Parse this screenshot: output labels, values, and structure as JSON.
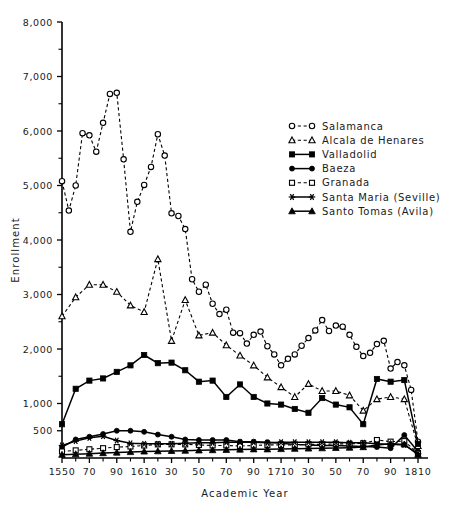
{
  "chart_data": {
    "type": "line",
    "title": "",
    "xlabel": "Academic Year",
    "ylabel": "Enrollment",
    "xlim": [
      1550,
      1810
    ],
    "ylim": [
      0,
      8000
    ],
    "grid": false,
    "legend_position": "right",
    "y_ticklabels": [
      "8,000",
      "7,000",
      "6,000",
      "5,000",
      "4,000",
      "3,000",
      "2,000",
      "1,000",
      "500"
    ],
    "y_tickvalues": [
      8000,
      7000,
      6000,
      5000,
      4000,
      3000,
      2000,
      1000,
      500
    ],
    "y_minor_tickvalues": [
      7500,
      6500,
      5500,
      4500,
      3500,
      2500,
      1500
    ],
    "x_ticklabels": [
      "1550",
      "70",
      "90",
      "1610",
      "30",
      "50",
      "70",
      "90",
      "1710",
      "30",
      "50",
      "70",
      "90",
      "1810"
    ],
    "x_tickvalues": [
      1550,
      1570,
      1590,
      1610,
      1630,
      1650,
      1670,
      1690,
      1710,
      1730,
      1750,
      1770,
      1790,
      1810
    ],
    "series": [
      {
        "name": "Salamanca",
        "marker": "circle-open",
        "linestyle": "dashed",
        "x": [
          1550,
          1555,
          1560,
          1565,
          1570,
          1575,
          1580,
          1585,
          1590,
          1595,
          1600,
          1605,
          1610,
          1615,
          1620,
          1625,
          1630,
          1635,
          1640,
          1645,
          1650,
          1655,
          1660,
          1665,
          1670,
          1675,
          1680,
          1685,
          1690,
          1695,
          1700,
          1705,
          1710,
          1715,
          1720,
          1725,
          1730,
          1735,
          1740,
          1745,
          1750,
          1755,
          1760,
          1765,
          1770,
          1775,
          1780,
          1785,
          1790,
          1795,
          1800,
          1805,
          1810
        ],
        "values": [
          5080,
          4540,
          5000,
          5960,
          5920,
          5620,
          6150,
          6680,
          6700,
          5480,
          4150,
          4700,
          5010,
          5340,
          5940,
          5550,
          4490,
          4440,
          4200,
          3280,
          3050,
          3180,
          2830,
          2640,
          2720,
          2300,
          2290,
          2100,
          2260,
          2320,
          2050,
          1900,
          1700,
          1820,
          1900,
          2060,
          2200,
          2340,
          2530,
          2330,
          2430,
          2410,
          2260,
          2040,
          1870,
          1930,
          2090,
          2150,
          1640,
          1760,
          1700,
          1250,
          300
        ]
      },
      {
        "name": "Alcala de Henares",
        "marker": "triangle-open",
        "linestyle": "dashed",
        "x": [
          1550,
          1560,
          1570,
          1580,
          1590,
          1600,
          1610,
          1620,
          1630,
          1640,
          1650,
          1660,
          1670,
          1680,
          1690,
          1700,
          1710,
          1720,
          1730,
          1740,
          1750,
          1760,
          1770,
          1780,
          1790,
          1800,
          1810
        ],
        "values": [
          2600,
          2950,
          3180,
          3180,
          3050,
          2800,
          2680,
          3650,
          2150,
          2900,
          2250,
          2300,
          2070,
          1880,
          1700,
          1480,
          1300,
          1120,
          1360,
          1230,
          1230,
          1150,
          870,
          1080,
          1120,
          1080,
          220
        ]
      },
      {
        "name": "Valladolid",
        "marker": "square-fill",
        "linestyle": "solid",
        "x": [
          1550,
          1560,
          1570,
          1580,
          1590,
          1600,
          1610,
          1620,
          1630,
          1640,
          1650,
          1660,
          1670,
          1680,
          1690,
          1700,
          1710,
          1720,
          1730,
          1740,
          1750,
          1760,
          1770,
          1780,
          1790,
          1800,
          1810
        ],
        "values": [
          620,
          1270,
          1420,
          1460,
          1580,
          1700,
          1890,
          1740,
          1750,
          1610,
          1400,
          1420,
          1120,
          1350,
          1120,
          1000,
          980,
          900,
          830,
          1100,
          980,
          930,
          620,
          1450,
          1400,
          1430,
          260
        ]
      },
      {
        "name": "Baeza",
        "marker": "circle-fill",
        "linestyle": "solid",
        "x": [
          1550,
          1560,
          1570,
          1580,
          1590,
          1600,
          1610,
          1620,
          1630,
          1640,
          1650,
          1660,
          1670,
          1680,
          1690,
          1700,
          1710,
          1720,
          1730,
          1740,
          1750,
          1760,
          1770,
          1780,
          1790,
          1800,
          1810
        ],
        "values": [
          200,
          340,
          390,
          440,
          500,
          500,
          480,
          430,
          390,
          340,
          330,
          330,
          330,
          300,
          300,
          290,
          270,
          250,
          240,
          230,
          230,
          220,
          210,
          200,
          180,
          420,
          120
        ]
      },
      {
        "name": "Granada",
        "marker": "square-open",
        "linestyle": "dashed",
        "x": [
          1550,
          1560,
          1570,
          1580,
          1590,
          1600,
          1610,
          1620,
          1630,
          1640,
          1650,
          1660,
          1670,
          1680,
          1690,
          1700,
          1710,
          1720,
          1730,
          1740,
          1750,
          1760,
          1770,
          1780,
          1790,
          1800,
          1810
        ],
        "values": [
          120,
          140,
          160,
          180,
          200,
          210,
          230,
          250,
          250,
          250,
          240,
          230,
          230,
          220,
          230,
          240,
          240,
          240,
          250,
          250,
          260,
          260,
          270,
          330,
          300,
          310,
          90
        ]
      },
      {
        "name": "Santa Maria (Seville)",
        "marker": "asterisk",
        "linestyle": "solid",
        "x": [
          1550,
          1560,
          1570,
          1580,
          1590,
          1600,
          1610,
          1620,
          1630,
          1640,
          1650,
          1660,
          1670,
          1680,
          1690,
          1700,
          1710,
          1720,
          1730,
          1740,
          1750,
          1760,
          1770,
          1780,
          1790,
          1800,
          1810
        ],
        "values": [
          230,
          310,
          370,
          400,
          320,
          270,
          260,
          260,
          260,
          270,
          280,
          280,
          290,
          290,
          290,
          280,
          290,
          290,
          290,
          290,
          290,
          280,
          280,
          260,
          250,
          240,
          80
        ]
      },
      {
        "name": "Santo Tomas (Avila)",
        "marker": "triangle-fill",
        "linestyle": "solid",
        "x": [
          1550,
          1560,
          1570,
          1580,
          1590,
          1600,
          1610,
          1620,
          1630,
          1640,
          1650,
          1660,
          1670,
          1680,
          1690,
          1700,
          1710,
          1720,
          1730,
          1740,
          1750,
          1760,
          1770,
          1780,
          1790,
          1800,
          1810
        ],
        "values": [
          60,
          70,
          80,
          90,
          100,
          110,
          120,
          125,
          130,
          135,
          140,
          145,
          150,
          155,
          160,
          160,
          165,
          170,
          175,
          180,
          185,
          190,
          200,
          240,
          260,
          250,
          60
        ]
      }
    ]
  },
  "legend": {
    "entries": [
      {
        "label": "Salamanca"
      },
      {
        "label": "Alcala de Henares"
      },
      {
        "label": "Valladolid"
      },
      {
        "label": "Baeza"
      },
      {
        "label": "Granada"
      },
      {
        "label": "Santa Maria (Seville)"
      },
      {
        "label": "Santo Tomas (Avila)"
      }
    ]
  },
  "axes": {
    "x_title": "Academic Year",
    "y_title": "Enrollment"
  },
  "colors": {
    "ink": "#000000",
    "background": "#ffffff"
  }
}
